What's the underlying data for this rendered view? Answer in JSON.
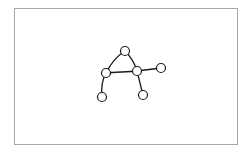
{
  "canvas": {
    "border_color": "#a8a8a8",
    "background": "#ffffff"
  },
  "glyph": {
    "letter": "A",
    "stroke_color": "#1a1a1a",
    "node_radius": 4.5,
    "nodes": [
      {
        "id": "top",
        "x": 125,
        "y": 51
      },
      {
        "id": "left-mid",
        "x": 106,
        "y": 73
      },
      {
        "id": "right-mid",
        "x": 137,
        "y": 71
      },
      {
        "id": "far-right",
        "x": 161,
        "y": 68
      },
      {
        "id": "left-bottom",
        "x": 102,
        "y": 97
      },
      {
        "id": "right-bottom",
        "x": 143,
        "y": 95
      }
    ],
    "strokes": [
      {
        "id": "left-leg",
        "path": "M102,97 C101,88 102,80 106,73 C111,63 117,56 125,51"
      },
      {
        "id": "right-leg",
        "path": "M125,51 C131,57 135,64 137,71 C139,79 141,87 143,95"
      },
      {
        "id": "crossbar",
        "path": "M106,73 C116,72 127,72 137,71 C145,70 153,69 161,68"
      }
    ]
  }
}
